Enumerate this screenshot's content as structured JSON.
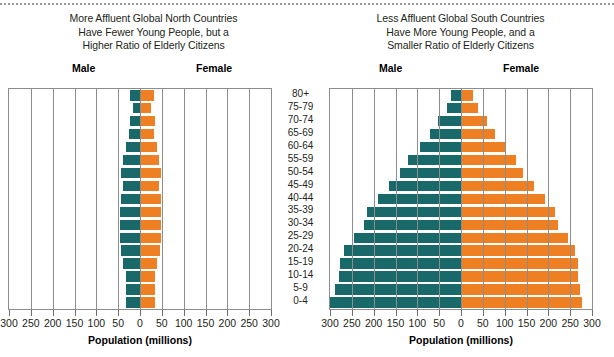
{
  "panels": [
    {
      "id": "global-north",
      "title_lines": [
        "More Affluent Global North Countries",
        "Have Fewer Young People, but a",
        "Higher Ratio of Elderly Citizens"
      ],
      "male_label": "Male",
      "female_label": "Female",
      "axis_title": "Population (millions)"
    },
    {
      "id": "global-south",
      "title_lines": [
        "Less Affluent Global South Countries",
        "Have More Young People, and a",
        "Smaller Ratio of Elderly Citizens"
      ],
      "male_label": "Male",
      "female_label": "Female",
      "axis_title": "Population (millions)"
    }
  ],
  "age_groups": [
    "80+",
    "75-79",
    "70-74",
    "65-69",
    "60-64",
    "55-59",
    "50-54",
    "45-49",
    "40-44",
    "35-39",
    "30-34",
    "25-29",
    "20-24",
    "15-19",
    "10-14",
    "5-9",
    "0-4"
  ],
  "tick_labels": [
    "300",
    "250",
    "200",
    "150",
    "100",
    "50",
    "0",
    "50",
    "100",
    "150",
    "200",
    "250",
    "300"
  ],
  "colors": {
    "male": "#19696b",
    "female": "#ee8023",
    "axis": "#8d8d8d",
    "text": "#231f20"
  },
  "chart_data": [
    {
      "type": "bar",
      "subtype": "population-pyramid",
      "title": "More Affluent Global North Countries Have Fewer Young People, but a Higher Ratio of Elderly Citizens",
      "xlabel": "Population (millions)",
      "ylabel": "",
      "xlim": [
        -300,
        300
      ],
      "grid": true,
      "xticks": [
        -300,
        -250,
        -200,
        -150,
        -100,
        -50,
        0,
        50,
        100,
        150,
        200,
        250,
        300
      ],
      "xticklabels": [
        "300",
        "250",
        "200",
        "150",
        "100",
        "50",
        "0",
        "50",
        "100",
        "150",
        "200",
        "250",
        "300"
      ],
      "categories": [
        "80+",
        "75-79",
        "70-74",
        "65-69",
        "60-64",
        "55-59",
        "50-54",
        "45-49",
        "40-44",
        "35-39",
        "30-34",
        "25-29",
        "20-24",
        "15-19",
        "10-14",
        "5-9",
        "0-4"
      ],
      "series": [
        {
          "name": "Male",
          "side": "left",
          "color": "#19696b",
          "values": [
            22,
            16,
            24,
            25,
            33,
            38,
            44,
            40,
            44,
            45,
            45,
            45,
            44,
            38,
            33,
            33,
            33
          ]
        },
        {
          "name": "Female",
          "side": "right",
          "color": "#ee8023",
          "values": [
            32,
            25,
            34,
            33,
            40,
            44,
            48,
            44,
            47,
            47,
            47,
            47,
            46,
            40,
            34,
            34,
            34
          ]
        }
      ],
      "legend_position": "top"
    },
    {
      "type": "bar",
      "subtype": "population-pyramid",
      "title": "Less Affluent Global South Countries Have More Young People, and a Smaller Ratio of Elderly Citizens",
      "xlabel": "Population (millions)",
      "ylabel": "",
      "xlim": [
        -300,
        300
      ],
      "grid": true,
      "xticks": [
        -300,
        -250,
        -200,
        -150,
        -100,
        -50,
        0,
        50,
        100,
        150,
        200,
        250,
        300
      ],
      "xticklabels": [
        "300",
        "250",
        "200",
        "150",
        "100",
        "50",
        "0",
        "50",
        "100",
        "150",
        "200",
        "250",
        "300"
      ],
      "categories": [
        "80+",
        "75-79",
        "70-74",
        "65-69",
        "60-64",
        "55-59",
        "50-54",
        "45-49",
        "40-44",
        "35-39",
        "30-34",
        "25-29",
        "20-24",
        "15-19",
        "10-14",
        "5-9",
        "0-4"
      ],
      "series": [
        {
          "name": "Male",
          "side": "left",
          "color": "#19696b",
          "values": [
            22,
            33,
            52,
            72,
            95,
            122,
            140,
            165,
            190,
            215,
            222,
            245,
            268,
            278,
            280,
            288,
            300
          ]
        },
        {
          "name": "Female",
          "side": "right",
          "color": "#ee8023",
          "values": [
            28,
            38,
            60,
            78,
            100,
            125,
            143,
            168,
            192,
            215,
            222,
            245,
            262,
            268,
            268,
            272,
            278
          ]
        }
      ],
      "legend_position": "top"
    }
  ]
}
